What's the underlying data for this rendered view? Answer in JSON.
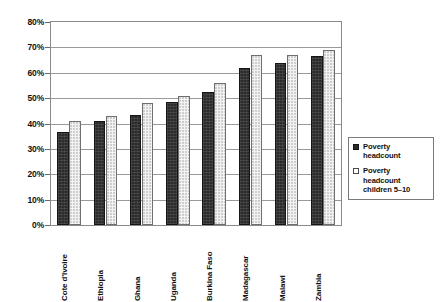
{
  "chart_data": {
    "type": "bar",
    "title": "",
    "xlabel": "",
    "ylabel": "",
    "ylim": [
      0,
      80
    ],
    "grid": true,
    "legend_position": "right",
    "y_ticks": [
      "0%",
      "10%",
      "20%",
      "30%",
      "40%",
      "50%",
      "60%",
      "70%",
      "80%"
    ],
    "y_tick_values": [
      0,
      10,
      20,
      30,
      40,
      50,
      60,
      70,
      80
    ],
    "categories": [
      "Cote d'Ivoire",
      "Ethiopia",
      "Ghana",
      "Uganda",
      "Burkina Faso",
      "Madagascar",
      "Malawi",
      "Zambia"
    ],
    "series": [
      {
        "name": "Poverty headcount",
        "color": "#2b2b2b",
        "values": [
          36.5,
          41.0,
          43.5,
          48.5,
          52.5,
          62.0,
          64.0,
          66.5
        ]
      },
      {
        "name": "Poverty headcount children 5–10",
        "color": "#ffffff",
        "values": [
          41.0,
          43.0,
          48.0,
          51.0,
          56.0,
          67.0,
          67.0,
          69.0
        ]
      }
    ]
  },
  "legend": {
    "items": [
      {
        "label_line1": "Poverty",
        "label_line2": "headcount",
        "label_line3": ""
      },
      {
        "label_line1": "Poverty",
        "label_line2": "headcount",
        "label_line3": "children 5–10"
      }
    ]
  }
}
